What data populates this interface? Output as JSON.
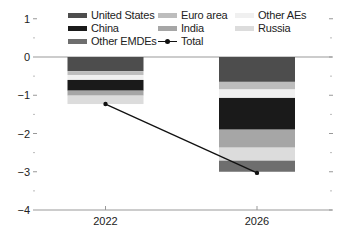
{
  "chart_data": {
    "type": "bar",
    "stacked": true,
    "title": "",
    "xlabel": "",
    "ylabel": "",
    "categories": [
      "2022",
      "2026"
    ],
    "ylim": [
      -4,
      1
    ],
    "yticks": [
      1,
      0,
      -1,
      -2,
      -3,
      -4
    ],
    "ytick_labels": [
      "1",
      "0",
      "−1",
      "−2",
      "−3",
      "−4"
    ],
    "grid": false,
    "legend_position": "top",
    "series": [
      {
        "name": "United States",
        "color": "#4d4d4d",
        "values": [
          -0.37,
          -0.65
        ]
      },
      {
        "name": "Euro area",
        "color": "#bdbdbd",
        "values": [
          -0.1,
          -0.2
        ]
      },
      {
        "name": "Other AEs",
        "color": "#f0f0f0",
        "values": [
          -0.13,
          -0.22
        ]
      },
      {
        "name": "China",
        "color": "#1a1a1a",
        "values": [
          -0.28,
          -0.83
        ]
      },
      {
        "name": "India",
        "color": "#a6a6a6",
        "values": [
          -0.13,
          -0.47
        ]
      },
      {
        "name": "Russia",
        "color": "#dcdcdc",
        "values": [
          -0.22,
          -0.34
        ]
      },
      {
        "name": "Other EMDEs",
        "color": "#6e6e6e",
        "values": [
          0.0,
          -0.29
        ]
      }
    ],
    "line_series": {
      "name": "Total",
      "color": "#111111",
      "values": [
        -1.23,
        -3.03
      ]
    }
  },
  "legend": {
    "items": [
      {
        "label": "United States",
        "color": "#4d4d4d"
      },
      {
        "label": "China",
        "color": "#1a1a1a"
      },
      {
        "label": "Other EMDEs",
        "color": "#6e6e6e"
      },
      {
        "label": "Euro area",
        "color": "#bdbdbd"
      },
      {
        "label": "India",
        "color": "#a6a6a6"
      },
      {
        "label": "Total",
        "color": "#111111"
      },
      {
        "label": "Other AEs",
        "color": "#f0f0f0"
      },
      {
        "label": "Russia",
        "color": "#dcdcdc"
      }
    ]
  }
}
